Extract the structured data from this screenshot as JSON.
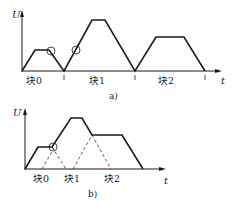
{
  "figure": {
    "panel_a": {
      "caption": "a)",
      "y_axis_label": "U",
      "x_axis_label": "t",
      "blocks": [
        {
          "label": "块0",
          "profile": "trapezoid",
          "start": 0,
          "peak_level": "low"
        },
        {
          "label": "块1",
          "profile": "trapezoid",
          "start": 1,
          "peak_level": "high"
        },
        {
          "label": "块2",
          "profile": "trapezoid",
          "start": 2,
          "peak_level": "medium"
        }
      ],
      "note": "Sequential blocks, velocity returns to zero between blocks; circles mark transition points"
    },
    "panel_b": {
      "caption": "b)",
      "y_axis_label": "U",
      "x_axis_label": "t",
      "blocks": [
        {
          "label": "块0"
        },
        {
          "label": "块1"
        },
        {
          "label": "块2"
        }
      ],
      "note": "Overlapping (blended) blocks; dashed lines show individual ramps; circle marks blend point"
    },
    "colors": {
      "line": "#1a1a1a",
      "background": "#ffffff"
    }
  }
}
